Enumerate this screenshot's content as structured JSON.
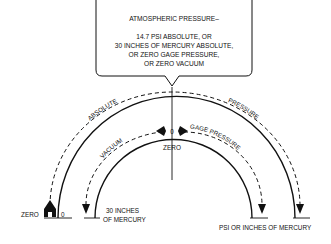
{
  "callout": {
    "title": "ATMOSPHERIC PRESSURE–",
    "lines": [
      "14.7 PSI ABSOLUTE, OR",
      "30 INCHES OF MERCURY ABSOLUTE,",
      "OR ZERO GAGE PRESSURE,",
      "OR ZERO VACUUM"
    ]
  },
  "arcs": {
    "outer_left_label": "ABSOLUTE",
    "outer_right_label": "PRESSURE",
    "inner_left_label": "VACUUM",
    "inner_right_label": "GAGE PRESSURE",
    "center_marker_value": "0",
    "center_label": "ZERO"
  },
  "bottom": {
    "zero_label": "ZERO",
    "zero_value": "0",
    "vacuum_end_label": [
      "30 INCHES",
      "OF MERCURY"
    ],
    "pressure_end_label": "PSI OR INCHES OF MERCURY"
  },
  "colors": {
    "ink": "#111111",
    "background": "#ffffff"
  }
}
